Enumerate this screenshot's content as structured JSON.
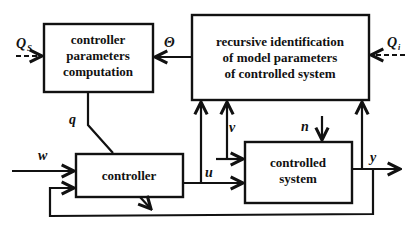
{
  "blocks": {
    "param_computation": {
      "lines": [
        "controller",
        "parameters",
        "computation"
      ]
    },
    "identification": {
      "lines": [
        "recursive identification",
        "of model parameters",
        "of controlled system"
      ]
    },
    "controller": {
      "lines": [
        "controller"
      ]
    },
    "controlled_system": {
      "lines": [
        "controlled",
        "system"
      ]
    }
  },
  "signals": {
    "qs": "Q",
    "qs_sub": "S",
    "qi": "Q",
    "qi_sub": "i",
    "theta": "Θ",
    "q": "q",
    "w": "w",
    "u": "u",
    "v": "v",
    "n": "n",
    "y": "y"
  }
}
